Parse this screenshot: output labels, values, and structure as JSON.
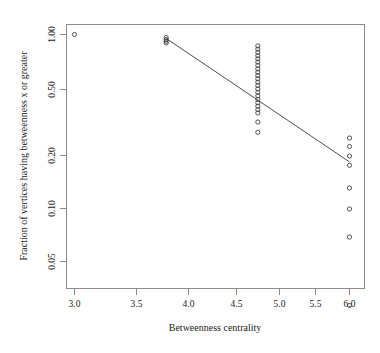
{
  "chart_data": {
    "type": "scatter",
    "title": "",
    "xlabel": "Betweenness centrality",
    "ylabel": "Fraction of vertices having betweenness x or greater",
    "xlim": [
      2.87,
      6.24
    ],
    "ylim_log": [
      0.025,
      1.12
    ],
    "yscale": "log",
    "xscale": "linear",
    "grid": false,
    "legend": null,
    "xticks": [
      3.0,
      3.5,
      4.0,
      4.5,
      5.0,
      5.5,
      6.0
    ],
    "xtick_labels": [
      "3.0",
      "3.5",
      "4.0",
      "4.5",
      "5.0",
      "5.5",
      "6.0"
    ],
    "yticks": [
      1.0,
      0.5,
      0.2,
      0.1,
      0.05
    ],
    "ytick_labels": [
      "1.00",
      "0.50",
      "0.20",
      "0.10",
      "0.05"
    ],
    "series": [
      {
        "name": "cumulative betweenness distribution",
        "marker": "open-circle",
        "points": [
          {
            "x": 3.0,
            "y": 1.0
          },
          {
            "x": 4.0,
            "y": 0.96
          },
          {
            "x": 4.0,
            "y": 0.935
          },
          {
            "x": 4.0,
            "y": 0.915
          },
          {
            "x": 4.0,
            "y": 0.895
          },
          {
            "x": 5.0,
            "y": 0.86
          },
          {
            "x": 5.0,
            "y": 0.825
          },
          {
            "x": 5.0,
            "y": 0.79
          },
          {
            "x": 5.0,
            "y": 0.755
          },
          {
            "x": 5.0,
            "y": 0.725
          },
          {
            "x": 5.0,
            "y": 0.695
          },
          {
            "x": 5.0,
            "y": 0.665
          },
          {
            "x": 5.0,
            "y": 0.635
          },
          {
            "x": 5.0,
            "y": 0.608
          },
          {
            "x": 5.0,
            "y": 0.582
          },
          {
            "x": 5.0,
            "y": 0.557
          },
          {
            "x": 5.0,
            "y": 0.533
          },
          {
            "x": 5.0,
            "y": 0.51
          },
          {
            "x": 5.0,
            "y": 0.488
          },
          {
            "x": 5.0,
            "y": 0.466
          },
          {
            "x": 5.0,
            "y": 0.445
          },
          {
            "x": 5.0,
            "y": 0.425
          },
          {
            "x": 5.0,
            "y": 0.406
          },
          {
            "x": 5.0,
            "y": 0.388
          },
          {
            "x": 5.0,
            "y": 0.371
          },
          {
            "x": 5.0,
            "y": 0.355
          },
          {
            "x": 5.0,
            "y": 0.315
          },
          {
            "x": 5.0,
            "y": 0.275
          },
          {
            "x": 6.0,
            "y": 0.255
          },
          {
            "x": 6.0,
            "y": 0.228
          },
          {
            "x": 6.0,
            "y": 0.201
          },
          {
            "x": 6.0,
            "y": 0.178
          },
          {
            "x": 6.0,
            "y": 0.132
          },
          {
            "x": 6.0,
            "y": 0.1
          },
          {
            "x": 6.0,
            "y": 0.069
          },
          {
            "x": 6.0,
            "y": 0.028
          }
        ]
      }
    ],
    "fit_line": {
      "name": "power-law fit",
      "x_start": 4.0,
      "y_start": 0.95,
      "x_end": 6.0,
      "y_end": 0.186
    },
    "annotations": []
  }
}
